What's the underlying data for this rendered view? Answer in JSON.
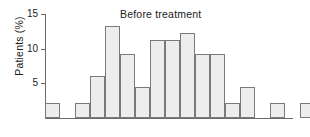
{
  "chart_data": {
    "type": "bar",
    "title": "Before treatment",
    "xlabel": "",
    "ylabel": "Patients (%)",
    "ylim": [
      0,
      15
    ],
    "ytick_values": [
      5,
      10,
      15
    ],
    "ytick_labels": [
      "5",
      "10",
      "15"
    ],
    "grid": false,
    "legend": null,
    "xtick_labels": [],
    "categories": [
      "1",
      "2",
      "3",
      "4",
      "5",
      "6",
      "7",
      "8",
      "9",
      "10",
      "11",
      "12",
      "13",
      "14",
      "15",
      "16",
      "17",
      "18",
      "19"
    ],
    "values": [
      2.2,
      0,
      2.2,
      6.1,
      13.2,
      9.2,
      4.4,
      11.2,
      11.2,
      12.2,
      9.2,
      9.2,
      2.2,
      4.4,
      0,
      2.2,
      0,
      2.2,
      2.2
    ],
    "bar_fill_color": "#ededed",
    "bar_edge_color": "#7a7a7a",
    "axis_color": "#6b6b6b",
    "text_color": "#1a1a1a",
    "background_color": "#ffffff"
  },
  "figure": {
    "title": "Before treatment",
    "ylabel": "Patients (%)"
  }
}
